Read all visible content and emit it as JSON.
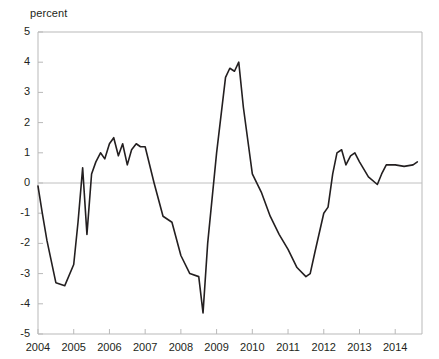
{
  "chart_data": {
    "type": "line",
    "title": "",
    "subtitle": "",
    "xlabel": "",
    "ylabel": "percent",
    "unit_label": "percent",
    "ylim": [
      -5,
      5
    ],
    "xlim": [
      2004,
      2014.75
    ],
    "grid": false,
    "legend": null,
    "zero_line": true,
    "line_color": "#231f20",
    "axis_color": "#b9b9b9",
    "ytick_labels": [
      "5",
      "4",
      "3",
      "2",
      "1",
      "0",
      "-1",
      "-2",
      "-3",
      "-4",
      "-5"
    ],
    "ytick_values": [
      5,
      4,
      3,
      2,
      1,
      0,
      -1,
      -2,
      -3,
      -4,
      -5
    ],
    "xtick_labels": [
      "2004",
      "2005",
      "2006",
      "2007",
      "2008",
      "2009",
      "2010",
      "2011",
      "2012",
      "2013",
      "2014"
    ],
    "xtick_values": [
      2004,
      2005,
      2006,
      2007,
      2008,
      2009,
      2010,
      2011,
      2012,
      2013,
      2014
    ],
    "series": [
      {
        "name": "percent change",
        "x": [
          2004.0,
          2004.12,
          2004.25,
          2004.5,
          2004.75,
          2005.0,
          2005.12,
          2005.25,
          2005.37,
          2005.5,
          2005.62,
          2005.75,
          2005.87,
          2006.0,
          2006.12,
          2006.25,
          2006.37,
          2006.5,
          2006.62,
          2006.75,
          2006.87,
          2007.0,
          2007.25,
          2007.5,
          2007.75,
          2008.0,
          2008.25,
          2008.5,
          2008.62,
          2008.75,
          2009.0,
          2009.25,
          2009.37,
          2009.5,
          2009.62,
          2009.75,
          2010.0,
          2010.25,
          2010.5,
          2010.75,
          2011.0,
          2011.25,
          2011.5,
          2011.62,
          2011.75,
          2012.0,
          2012.12,
          2012.25,
          2012.37,
          2012.5,
          2012.62,
          2012.75,
          2012.87,
          2013.0,
          2013.25,
          2013.5,
          2013.62,
          2013.75,
          2014.0,
          2014.25,
          2014.5,
          2014.62
        ],
        "y": [
          -0.1,
          -1.0,
          -1.9,
          -3.3,
          -3.4,
          -2.7,
          -1.3,
          0.5,
          -1.7,
          0.3,
          0.7,
          1.0,
          0.8,
          1.3,
          1.5,
          0.9,
          1.3,
          0.6,
          1.1,
          1.3,
          1.2,
          1.2,
          0.0,
          -1.1,
          -1.3,
          -2.4,
          -3.0,
          -3.1,
          -4.3,
          -2.0,
          1.0,
          3.5,
          3.8,
          3.7,
          4.0,
          2.5,
          0.3,
          -0.3,
          -1.1,
          -1.7,
          -2.2,
          -2.8,
          -3.1,
          -3.0,
          -2.3,
          -1.0,
          -0.8,
          0.3,
          1.0,
          1.1,
          0.6,
          0.9,
          1.0,
          0.7,
          0.2,
          -0.05,
          0.3,
          0.6,
          0.6,
          0.55,
          0.6,
          0.7
        ]
      }
    ],
    "annotations": []
  },
  "geometry": {
    "plot_left": 38,
    "plot_right": 422,
    "plot_top": 32,
    "plot_bottom": 334
  }
}
